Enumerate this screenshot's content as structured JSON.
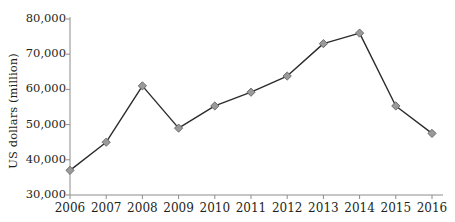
{
  "chart_data": {
    "type": "line",
    "title": "",
    "xlabel": "",
    "ylabel": "US dollars (million)",
    "categories": [
      "2006",
      "2007",
      "2008",
      "2009",
      "2010",
      "2011",
      "2012",
      "2013",
      "2014",
      "2015",
      "2016"
    ],
    "values": [
      37000,
      45000,
      61000,
      49000,
      55300,
      59200,
      63800,
      73000,
      76000,
      55300,
      47500
    ],
    "series": [
      {
        "name": "US dollars (million)",
        "values": [
          37000,
          45000,
          61000,
          49000,
          55300,
          59200,
          63800,
          73000,
          76000,
          55300,
          47500
        ]
      }
    ],
    "ylim": [
      30000,
      80000
    ],
    "y_ticks": [
      30000,
      40000,
      50000,
      60000,
      70000,
      80000
    ],
    "y_tick_labels": [
      "30,000",
      "40,000",
      "50,000",
      "60,000",
      "70,000",
      "80,000"
    ],
    "x_tick_labels": [
      "2006",
      "2007",
      "2008",
      "2009",
      "2010",
      "2011",
      "2012",
      "2013",
      "2014",
      "2015",
      "2016"
    ],
    "grid": false,
    "legend": false,
    "legend_position": "none",
    "marker": "diamond",
    "line_color": "#2b2b2b",
    "marker_fill": "#9a9a9a",
    "marker_stroke": "#6d6d6d",
    "axis_color": "#8c8c8c",
    "text_color": "#231f20",
    "background": "#ffffff"
  }
}
